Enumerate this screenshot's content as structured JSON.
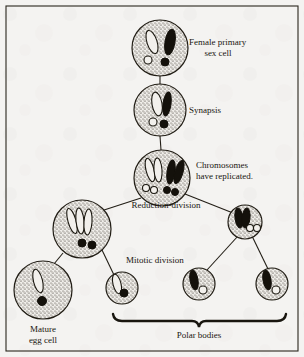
{
  "figure": {
    "title_visible": false,
    "background_color": "#f4f3f1",
    "ink_color": "#19160f",
    "border": true
  },
  "labels": {
    "female_primary_sex_cell_line1": "Female primary",
    "female_primary_sex_cell_line2": "sex cell",
    "synapsis": "Synapsis",
    "chromosomes_replicated_line1": "Chromosomes",
    "chromosomes_replicated_line2": "have replicated.",
    "reduction_division": "Reduction-division",
    "mitotic_division": "Mitotic division",
    "mature_egg_cell_line1": "Mature",
    "mature_egg_cell_line2": "egg cell",
    "polar_bodies": "Polar bodies"
  },
  "cells": [
    {
      "name": "female-primary-sex-cell",
      "cx": 160,
      "cy": 48,
      "r": 28,
      "stage": "Female primary sex cell",
      "chromosomes": [
        {
          "type": "rod",
          "fill": "white",
          "cx": 152,
          "cy": 42,
          "rx": 5,
          "ry": 12,
          "rot": -18
        },
        {
          "type": "rod",
          "fill": "black",
          "cx": 170,
          "cy": 42,
          "rx": 5,
          "ry": 13,
          "rot": 10
        }
      ],
      "dots": [
        {
          "fill": "white",
          "cx": 148,
          "cy": 60,
          "r": 4
        },
        {
          "fill": "black",
          "cx": 165,
          "cy": 62,
          "r": 4
        }
      ]
    },
    {
      "name": "synapsis-cell",
      "cx": 160,
      "cy": 110,
      "r": 26,
      "stage": "Synapsis",
      "chromosomes": [
        {
          "type": "rod",
          "fill": "white",
          "cx": 157,
          "cy": 104,
          "rx": 5,
          "ry": 12,
          "rot": -10
        },
        {
          "type": "rod",
          "fill": "black",
          "cx": 167,
          "cy": 104,
          "rx": 4,
          "ry": 12,
          "rot": 8
        }
      ],
      "dots": [
        {
          "fill": "white",
          "cx": 154,
          "cy": 122,
          "r": 4
        },
        {
          "fill": "black",
          "cx": 164,
          "cy": 124,
          "r": 4
        }
      ]
    },
    {
      "name": "replicated-chromosomes-cell",
      "cx": 162,
      "cy": 178,
      "r": 28,
      "stage": "Chromosomes have replicated.",
      "chromosomes": [
        {
          "type": "rod",
          "fill": "white",
          "cx": 150,
          "cy": 170,
          "rx": 4,
          "ry": 12,
          "rot": -14
        },
        {
          "type": "rod",
          "fill": "white",
          "cx": 158,
          "cy": 170,
          "rx": 4,
          "ry": 12,
          "rot": -4
        },
        {
          "type": "rod",
          "fill": "black",
          "cx": 171,
          "cy": 172,
          "rx": 4,
          "ry": 12,
          "rot": 8
        },
        {
          "type": "rod",
          "fill": "black",
          "cx": 179,
          "cy": 172,
          "rx": 4,
          "ry": 12,
          "rot": 16
        }
      ],
      "dots": [
        {
          "fill": "white",
          "cx": 146,
          "cy": 188,
          "r": 3.5
        },
        {
          "fill": "white",
          "cx": 154,
          "cy": 190,
          "r": 3.5
        },
        {
          "fill": "black",
          "cx": 167,
          "cy": 190,
          "r": 3.5
        },
        {
          "fill": "black",
          "cx": 175,
          "cy": 192,
          "r": 3.5
        }
      ]
    },
    {
      "name": "secondary-oocyte-cell",
      "cx": 82,
      "cy": 229,
      "r": 29,
      "stage": "Secondary oocyte (after reduction-division)",
      "chromosomes": [
        {
          "type": "rod",
          "fill": "white",
          "cx": 72,
          "cy": 221,
          "rx": 4,
          "ry": 13,
          "rot": -16
        },
        {
          "type": "rod",
          "fill": "white",
          "cx": 80,
          "cy": 221,
          "rx": 4,
          "ry": 13,
          "rot": -6
        },
        {
          "type": "rod",
          "fill": "white",
          "cx": 88,
          "cy": 222,
          "rx": 4,
          "ry": 13,
          "rot": 4
        }
      ],
      "dots": [
        {
          "fill": "black",
          "cx": 82,
          "cy": 243,
          "r": 4
        },
        {
          "fill": "black",
          "cx": 92,
          "cy": 245,
          "r": 4
        }
      ]
    },
    {
      "name": "first-polar-body-cell",
      "cx": 245,
      "cy": 222,
      "r": 17,
      "stage": "First polar body",
      "chromosomes": [
        {
          "type": "rod",
          "fill": "black",
          "cx": 239,
          "cy": 218,
          "rx": 4,
          "ry": 10,
          "rot": -8
        },
        {
          "type": "rod",
          "fill": "black",
          "cx": 246,
          "cy": 218,
          "rx": 4,
          "ry": 10,
          "rot": 6
        }
      ],
      "dots": [
        {
          "fill": "white",
          "cx": 250,
          "cy": 228,
          "r": 3.5
        },
        {
          "fill": "white",
          "cx": 257,
          "cy": 228,
          "r": 3.5
        }
      ]
    },
    {
      "name": "mature-egg-cell",
      "cx": 43,
      "cy": 290,
      "r": 29,
      "stage": "Mature egg cell",
      "chromosomes": [
        {
          "type": "rod",
          "fill": "white",
          "cx": 38,
          "cy": 281,
          "rx": 4.5,
          "ry": 12,
          "rot": -14
        }
      ],
      "dots": [
        {
          "fill": "black",
          "cx": 42,
          "cy": 301,
          "r": 4.5
        }
      ]
    },
    {
      "name": "polar-body-cell-1",
      "cx": 122,
      "cy": 288,
      "r": 16,
      "stage": "Polar body",
      "chromosomes": [
        {
          "type": "rod",
          "fill": "white",
          "cx": 117,
          "cy": 284,
          "rx": 4,
          "ry": 10,
          "rot": -14
        }
      ],
      "dots": [
        {
          "fill": "black",
          "cx": 124,
          "cy": 293,
          "r": 4
        }
      ]
    },
    {
      "name": "polar-body-cell-2",
      "cx": 199,
      "cy": 284,
      "r": 16,
      "stage": "Polar body",
      "chromosomes": [
        {
          "type": "rod",
          "fill": "black",
          "cx": 194,
          "cy": 280,
          "rx": 4,
          "ry": 10,
          "rot": -10
        }
      ],
      "dots": [
        {
          "fill": "white",
          "cx": 203,
          "cy": 290,
          "r": 4
        }
      ]
    },
    {
      "name": "polar-body-cell-3",
      "cx": 272,
      "cy": 284,
      "r": 16,
      "stage": "Polar body",
      "chromosomes": [
        {
          "type": "rod",
          "fill": "black",
          "cx": 267,
          "cy": 280,
          "rx": 4,
          "ry": 10,
          "rot": -10
        }
      ],
      "dots": [
        {
          "fill": "white",
          "cx": 276,
          "cy": 290,
          "r": 4
        }
      ]
    }
  ],
  "connectors": [
    {
      "name": "connector-primary-to-synapsis",
      "x1": 160,
      "y1": 76,
      "x2": 160,
      "y2": 84
    },
    {
      "name": "connector-synapsis-to-replicated",
      "x1": 160,
      "y1": 136,
      "x2": 161,
      "y2": 150
    },
    {
      "name": "connector-replicated-to-secondary",
      "x1": 140,
      "y1": 198,
      "x2": 100,
      "y2": 212
    },
    {
      "name": "connector-replicated-to-first-polar",
      "x1": 184,
      "y1": 195,
      "x2": 233,
      "y2": 213
    },
    {
      "name": "connector-secondary-to-egg",
      "x1": 64,
      "y1": 252,
      "x2": 54,
      "y2": 265
    },
    {
      "name": "connector-secondary-to-polar1",
      "x1": 101,
      "y1": 250,
      "x2": 114,
      "y2": 275
    },
    {
      "name": "connector-firstpolar-to-polar2",
      "x1": 238,
      "y1": 236,
      "x2": 207,
      "y2": 270
    },
    {
      "name": "connector-firstpolar-to-polar3",
      "x1": 252,
      "y1": 236,
      "x2": 268,
      "y2": 269
    }
  ],
  "brace": {
    "name": "polar-bodies-brace",
    "x_left": 113,
    "x_right": 285,
    "y": 320,
    "tip_x": 199
  }
}
